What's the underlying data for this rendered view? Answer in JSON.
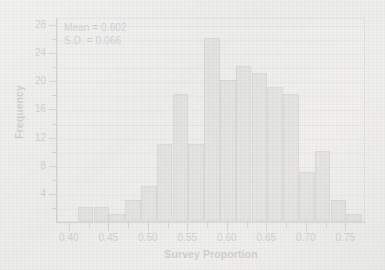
{
  "chart_data": {
    "type": "bar",
    "subtype": "histogram",
    "title": "",
    "xlabel": "Survey Proportion",
    "ylabel": "Frequency",
    "xlim": [
      0.385,
      0.775
    ],
    "ylim": [
      0,
      29
    ],
    "grid": true,
    "legend": null,
    "bin_width": 0.02,
    "bin_starts": [
      0.41,
      0.43,
      0.45,
      0.47,
      0.49,
      0.51,
      0.53,
      0.55,
      0.57,
      0.59,
      0.61,
      0.63,
      0.65,
      0.67,
      0.69,
      0.71,
      0.73,
      0.75
    ],
    "bin_ends": [
      0.43,
      0.45,
      0.47,
      0.49,
      0.51,
      0.53,
      0.55,
      0.57,
      0.59,
      0.61,
      0.63,
      0.65,
      0.67,
      0.69,
      0.71,
      0.73,
      0.75,
      0.77
    ],
    "categories": [
      "0.41-0.43",
      "0.43-0.45",
      "0.45-0.47",
      "0.47-0.49",
      "0.49-0.51",
      "0.51-0.53",
      "0.53-0.55",
      "0.55-0.57",
      "0.57-0.59",
      "0.59-0.61",
      "0.61-0.63",
      "0.63-0.65",
      "0.65-0.67",
      "0.67-0.69",
      "0.69-0.71",
      "0.71-0.73",
      "0.73-0.75",
      "0.75-0.77"
    ],
    "values": [
      2,
      2,
      1,
      3,
      5,
      11,
      18,
      11,
      26,
      20,
      22,
      21,
      19,
      18,
      7,
      10,
      3,
      1
    ],
    "x_ticks": [
      0.4,
      0.45,
      0.5,
      0.55,
      0.6,
      0.65,
      0.7,
      0.75
    ],
    "x_tick_labels": [
      "0.40",
      "0.45",
      "0.50",
      "0.55",
      "0.60",
      "0.65",
      "0.70",
      "0.75"
    ],
    "x_minor_ticks": [
      0.425,
      0.475,
      0.525,
      0.575,
      0.625,
      0.675,
      0.725
    ],
    "y_ticks": [
      4,
      8,
      12,
      16,
      20,
      24,
      28
    ],
    "y_tick_labels": [
      "4",
      "8",
      "12",
      "16",
      "20",
      "24",
      "28"
    ],
    "y_minor_ticks": [
      2,
      6,
      10,
      14,
      18,
      22,
      26
    ],
    "gridlines_y": [
      2,
      4,
      6,
      8,
      10,
      12,
      14,
      16,
      18,
      20,
      22,
      24,
      26,
      28
    ],
    "annotations": [
      {
        "text": "Mean = 0.602",
        "name": "mean-annotation"
      },
      {
        "text": "S.D. = 0.066",
        "name": "sd-annotation"
      }
    ],
    "colors": {
      "bar_fill": "#adadad",
      "bar_edge": "#6e6e6e",
      "grid": "#c9c9c7",
      "axis": "#555555",
      "text": "#1a1a1a",
      "plot_background": "#f7f7f6",
      "page_background": "#efefee"
    }
  }
}
